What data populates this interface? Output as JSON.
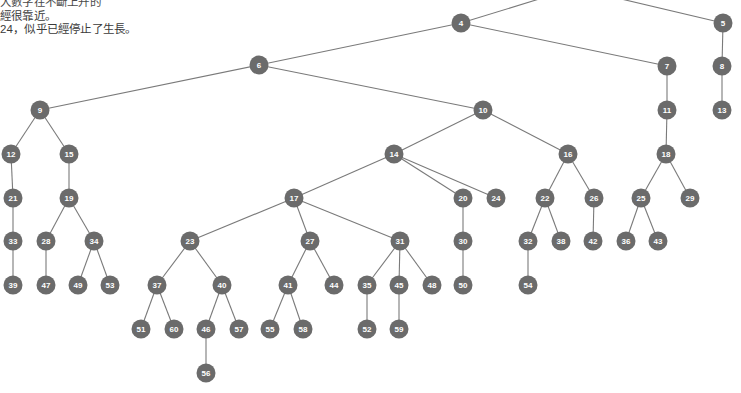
{
  "page": {
    "background_color": "#ffffff"
  },
  "notes": {
    "lines": [
      "大數字在不斷上升的",
      "經很靠近。",
      "24，似乎已經停止了生長。"
    ],
    "line1": "大數字在不斷上升的",
    "line2": "經很靠近。",
    "line3": "24，似乎已經停止了生長。",
    "text_color": "#3a3a3a"
  },
  "graph": {
    "node_fill": "#6b6b6b",
    "node_label_color": "#ffffff",
    "edge_color": "#7a7a7a",
    "node_radius": 9.5,
    "nodes": [
      {
        "id": "4",
        "label": "4",
        "x": 461,
        "y": 23
      },
      {
        "id": "5",
        "label": "5",
        "x": 723,
        "y": 23
      },
      {
        "id": "6",
        "label": "6",
        "x": 259,
        "y": 65
      },
      {
        "id": "7",
        "label": "7",
        "x": 667,
        "y": 66
      },
      {
        "id": "8",
        "label": "8",
        "x": 722,
        "y": 66
      },
      {
        "id": "9",
        "label": "9",
        "x": 40,
        "y": 110
      },
      {
        "id": "10",
        "label": "10",
        "x": 483,
        "y": 110
      },
      {
        "id": "11",
        "label": "11",
        "x": 667,
        "y": 110
      },
      {
        "id": "13",
        "label": "13",
        "x": 722,
        "y": 110
      },
      {
        "id": "12",
        "label": "12",
        "x": 11,
        "y": 154
      },
      {
        "id": "15",
        "label": "15",
        "x": 69,
        "y": 154
      },
      {
        "id": "14",
        "label": "14",
        "x": 394,
        "y": 154
      },
      {
        "id": "16",
        "label": "16",
        "x": 568,
        "y": 154
      },
      {
        "id": "18",
        "label": "18",
        "x": 666,
        "y": 154
      },
      {
        "id": "21",
        "label": "21",
        "x": 13,
        "y": 198
      },
      {
        "id": "19",
        "label": "19",
        "x": 69,
        "y": 198
      },
      {
        "id": "17",
        "label": "17",
        "x": 294,
        "y": 198
      },
      {
        "id": "20",
        "label": "20",
        "x": 463,
        "y": 198
      },
      {
        "id": "24",
        "label": "24",
        "x": 496,
        "y": 198
      },
      {
        "id": "22",
        "label": "22",
        "x": 545,
        "y": 198
      },
      {
        "id": "26",
        "label": "26",
        "x": 594,
        "y": 198
      },
      {
        "id": "25",
        "label": "25",
        "x": 641,
        "y": 198
      },
      {
        "id": "29",
        "label": "29",
        "x": 690,
        "y": 198
      },
      {
        "id": "33",
        "label": "33",
        "x": 13,
        "y": 241
      },
      {
        "id": "28",
        "label": "28",
        "x": 46,
        "y": 241
      },
      {
        "id": "34",
        "label": "34",
        "x": 94,
        "y": 241
      },
      {
        "id": "23",
        "label": "23",
        "x": 190,
        "y": 241
      },
      {
        "id": "27",
        "label": "27",
        "x": 310,
        "y": 241
      },
      {
        "id": "31",
        "label": "31",
        "x": 400,
        "y": 241
      },
      {
        "id": "30",
        "label": "30",
        "x": 463,
        "y": 241
      },
      {
        "id": "32",
        "label": "32",
        "x": 528,
        "y": 241
      },
      {
        "id": "38",
        "label": "38",
        "x": 561,
        "y": 241
      },
      {
        "id": "42",
        "label": "42",
        "x": 593,
        "y": 241
      },
      {
        "id": "36",
        "label": "36",
        "x": 626,
        "y": 241
      },
      {
        "id": "43",
        "label": "43",
        "x": 658,
        "y": 241
      },
      {
        "id": "39",
        "label": "39",
        "x": 13,
        "y": 285
      },
      {
        "id": "47",
        "label": "47",
        "x": 46,
        "y": 285
      },
      {
        "id": "49",
        "label": "49",
        "x": 78,
        "y": 285
      },
      {
        "id": "53",
        "label": "53",
        "x": 110,
        "y": 285
      },
      {
        "id": "37",
        "label": "37",
        "x": 157,
        "y": 285
      },
      {
        "id": "40",
        "label": "40",
        "x": 222,
        "y": 285
      },
      {
        "id": "41",
        "label": "41",
        "x": 288,
        "y": 285
      },
      {
        "id": "44",
        "label": "44",
        "x": 334,
        "y": 285
      },
      {
        "id": "35",
        "label": "35",
        "x": 367,
        "y": 285
      },
      {
        "id": "45",
        "label": "45",
        "x": 399,
        "y": 285
      },
      {
        "id": "48",
        "label": "48",
        "x": 432,
        "y": 285
      },
      {
        "id": "50",
        "label": "50",
        "x": 463,
        "y": 285
      },
      {
        "id": "54",
        "label": "54",
        "x": 528,
        "y": 285
      },
      {
        "id": "51",
        "label": "51",
        "x": 141,
        "y": 329
      },
      {
        "id": "60",
        "label": "60",
        "x": 174,
        "y": 329
      },
      {
        "id": "46",
        "label": "46",
        "x": 206,
        "y": 329
      },
      {
        "id": "57",
        "label": "57",
        "x": 239,
        "y": 329
      },
      {
        "id": "55",
        "label": "55",
        "x": 270,
        "y": 329
      },
      {
        "id": "58",
        "label": "58",
        "x": 303,
        "y": 329
      },
      {
        "id": "52",
        "label": "52",
        "x": 367,
        "y": 329
      },
      {
        "id": "59",
        "label": "59",
        "x": 399,
        "y": 329
      },
      {
        "id": "56",
        "label": "56",
        "x": 206,
        "y": 373
      }
    ],
    "edges": [
      {
        "from": "4",
        "to": "6"
      },
      {
        "from": "4",
        "to": "7"
      },
      {
        "from": "5",
        "to": "8"
      },
      {
        "from": "8",
        "to": "13"
      },
      {
        "from": "7",
        "to": "11"
      },
      {
        "from": "11",
        "to": "18"
      },
      {
        "from": "6",
        "to": "9"
      },
      {
        "from": "6",
        "to": "10"
      },
      {
        "from": "9",
        "to": "12"
      },
      {
        "from": "9",
        "to": "15"
      },
      {
        "from": "12",
        "to": "21"
      },
      {
        "from": "15",
        "to": "19"
      },
      {
        "from": "21",
        "to": "33"
      },
      {
        "from": "19",
        "to": "28"
      },
      {
        "from": "19",
        "to": "34"
      },
      {
        "from": "33",
        "to": "39"
      },
      {
        "from": "28",
        "to": "47"
      },
      {
        "from": "34",
        "to": "49"
      },
      {
        "from": "34",
        "to": "53"
      },
      {
        "from": "10",
        "to": "14"
      },
      {
        "from": "10",
        "to": "16"
      },
      {
        "from": "14",
        "to": "17"
      },
      {
        "from": "14",
        "to": "20"
      },
      {
        "from": "14",
        "to": "24"
      },
      {
        "from": "17",
        "to": "23"
      },
      {
        "from": "17",
        "to": "27"
      },
      {
        "from": "17",
        "to": "31"
      },
      {
        "from": "20",
        "to": "30"
      },
      {
        "from": "30",
        "to": "50"
      },
      {
        "from": "23",
        "to": "37"
      },
      {
        "from": "23",
        "to": "40"
      },
      {
        "from": "37",
        "to": "51"
      },
      {
        "from": "37",
        "to": "60"
      },
      {
        "from": "40",
        "to": "46"
      },
      {
        "from": "40",
        "to": "57"
      },
      {
        "from": "46",
        "to": "56"
      },
      {
        "from": "27",
        "to": "41"
      },
      {
        "from": "27",
        "to": "44"
      },
      {
        "from": "41",
        "to": "55"
      },
      {
        "from": "41",
        "to": "58"
      },
      {
        "from": "31",
        "to": "35"
      },
      {
        "from": "31",
        "to": "45"
      },
      {
        "from": "31",
        "to": "48"
      },
      {
        "from": "35",
        "to": "52"
      },
      {
        "from": "45",
        "to": "59"
      },
      {
        "from": "16",
        "to": "22"
      },
      {
        "from": "16",
        "to": "26"
      },
      {
        "from": "22",
        "to": "32"
      },
      {
        "from": "22",
        "to": "38"
      },
      {
        "from": "26",
        "to": "42"
      },
      {
        "from": "32",
        "to": "54"
      },
      {
        "from": "18",
        "to": "25"
      },
      {
        "from": "18",
        "to": "29"
      },
      {
        "from": "25",
        "to": "36"
      },
      {
        "from": "25",
        "to": "43"
      }
    ],
    "offscreen_edges": [
      {
        "to": "4",
        "from_x": 575,
        "from_y": -12
      },
      {
        "to": "5",
        "from_x": 600,
        "from_y": -6
      }
    ]
  }
}
